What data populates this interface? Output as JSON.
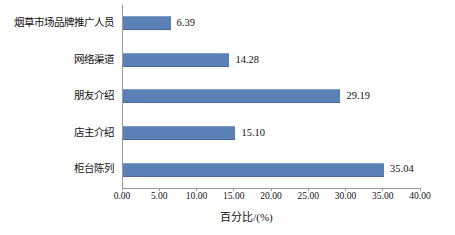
{
  "chart_data": {
    "type": "bar",
    "orientation": "horizontal",
    "title": "",
    "xlabel": "百分比/(%)",
    "ylabel": "",
    "categories": [
      "烟草市场品牌推广人员",
      "网络渠道",
      "朋友介绍",
      "店主介绍",
      "柜台陈列"
    ],
    "values": [
      6.39,
      14.28,
      29.19,
      15.1,
      35.04
    ],
    "value_labels": [
      "6.39",
      "14.28",
      "29.19",
      "15.10",
      "35.04"
    ],
    "xlim": [
      0,
      40
    ],
    "xtick_values": [
      0,
      5,
      10,
      15,
      20,
      25,
      30,
      35,
      40
    ],
    "xtick_labels": [
      "0.00",
      "5.00",
      "10.00",
      "15.00",
      "20.00",
      "25.00",
      "30.00",
      "35.00",
      "40.00"
    ],
    "grid": false,
    "legend": false,
    "bar_color": "#5b80b5",
    "axis_color": "#9a9a9a",
    "text_color": "#111111",
    "background_color": "#ffffff"
  }
}
